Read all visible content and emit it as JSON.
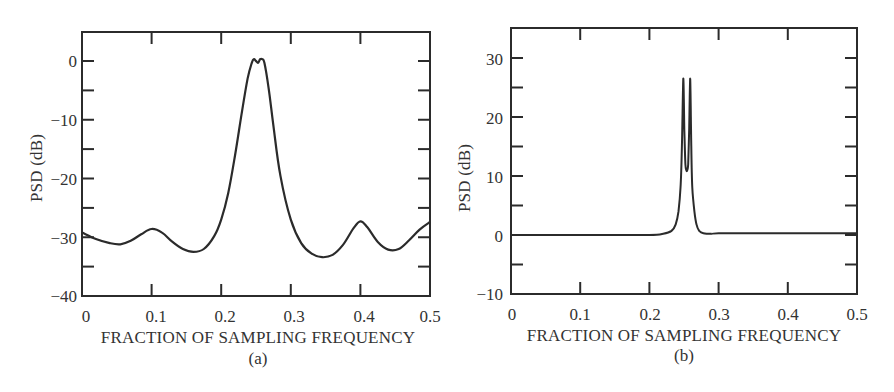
{
  "chart_data": [
    {
      "id": "a",
      "type": "line",
      "caption": "(a)",
      "title": "",
      "xlabel": "FRACTION OF SAMPLING FREQUENCY",
      "ylabel": "PSD (dB)",
      "xlim": [
        0,
        0.5
      ],
      "ylim": [
        -40,
        5
      ],
      "xticks": [
        0,
        0.1,
        0.2,
        0.3,
        0.4,
        0.5
      ],
      "xtick_labels": [
        "0",
        "0.1",
        "0.2",
        "0.3",
        "0.4",
        "0.5"
      ],
      "yticks": [
        0,
        -10,
        -20,
        -30,
        -40
      ],
      "ytick_labels": [
        "0",
        "−10",
        "−20",
        "−30",
        "−40"
      ],
      "grid": false,
      "legend": null,
      "series": [
        {
          "name": "PSD",
          "x": [
            0,
            0.02,
            0.04,
            0.055,
            0.07,
            0.085,
            0.1,
            0.115,
            0.13,
            0.145,
            0.16,
            0.175,
            0.19,
            0.2,
            0.21,
            0.22,
            0.23,
            0.238,
            0.244,
            0.247,
            0.25,
            0.253,
            0.256,
            0.259,
            0.262,
            0.268,
            0.275,
            0.285,
            0.3,
            0.315,
            0.33,
            0.345,
            0.36,
            0.375,
            0.39,
            0.4,
            0.41,
            0.425,
            0.44,
            0.455,
            0.47,
            0.485,
            0.5
          ],
          "y": [
            -29.2,
            -30.3,
            -31.0,
            -31.2,
            -30.6,
            -29.5,
            -28.6,
            -29.2,
            -30.8,
            -32.0,
            -32.5,
            -32.0,
            -29.8,
            -27.0,
            -22.5,
            -16.0,
            -8.5,
            -3.0,
            -0.3,
            0.3,
            0.0,
            -0.3,
            0.3,
            0.3,
            -0.3,
            -4.5,
            -11.0,
            -19.5,
            -27.0,
            -31.0,
            -32.8,
            -33.4,
            -33.0,
            -31.3,
            -28.5,
            -27.3,
            -28.3,
            -30.8,
            -32.1,
            -32.0,
            -30.5,
            -28.7,
            -27.4
          ]
        }
      ]
    },
    {
      "id": "b",
      "type": "line",
      "caption": "(b)",
      "title": "",
      "xlabel": "FRACTION OF SAMPLING FREQUENCY",
      "ylabel": "PSD (dB)",
      "xlim": [
        0,
        0.5
      ],
      "ylim": [
        -10,
        35
      ],
      "xticks": [
        0,
        0.1,
        0.2,
        0.3,
        0.4,
        0.5
      ],
      "xtick_labels": [
        "0",
        "0.1",
        "0.2",
        "0.3",
        "0.4",
        "0.5"
      ],
      "yticks": [
        30,
        20,
        10,
        0,
        -10
      ],
      "ytick_labels": [
        "30",
        "20",
        "10",
        "0",
        "−10"
      ],
      "grid": false,
      "legend": null,
      "series": [
        {
          "name": "PSD",
          "x": [
            0,
            0.1,
            0.2,
            0.22,
            0.232,
            0.238,
            0.242,
            0.245,
            0.247,
            0.249,
            0.2505,
            0.252,
            0.254,
            0.256,
            0.2575,
            0.259,
            0.2605,
            0.262,
            0.265,
            0.268,
            0.272,
            0.278,
            0.29,
            0.3,
            0.4,
            0.5
          ],
          "y": [
            0,
            0,
            0,
            0.2,
            0.7,
            1.8,
            4.0,
            8.0,
            15.0,
            26.5,
            18.0,
            12.0,
            10.8,
            12.0,
            18.0,
            26.5,
            15.0,
            8.0,
            4.0,
            1.8,
            0.7,
            0.3,
            0.2,
            0.3,
            0.3,
            0.3
          ]
        }
      ]
    }
  ],
  "panels": {
    "a": {
      "caption": "(a)",
      "xlabel": "FRACTION OF SAMPLING FREQUENCY",
      "ylabel": "PSD (dB)",
      "xticks": [
        "0",
        "0.1",
        "0.2",
        "0.3",
        "0.4",
        "0.5"
      ],
      "yticks": [
        "0",
        "−10",
        "−20",
        "−30",
        "−40"
      ]
    },
    "b": {
      "caption": "(b)",
      "xlabel": "FRACTION OF SAMPLING FREQUENCY",
      "ylabel": "PSD (dB)",
      "xticks": [
        "0",
        "0.1",
        "0.2",
        "0.3",
        "0.4",
        "0.5"
      ],
      "yticks": [
        "30",
        "20",
        "10",
        "0",
        "−10"
      ]
    }
  },
  "style": {
    "line_color": "#2b2b2b",
    "axis_color": "#2b2b2b",
    "background": "#ffffff"
  }
}
